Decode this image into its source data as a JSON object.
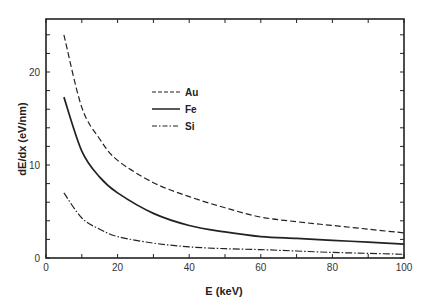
{
  "chart_data": {
    "type": "line",
    "title": "",
    "xlabel": "E (keV)",
    "ylabel": "dE/dx (eV/nm)",
    "xlim": [
      0,
      100
    ],
    "ylim": [
      0,
      25.7
    ],
    "xticks": [
      0,
      20,
      40,
      60,
      80,
      100
    ],
    "xtick_labels": [
      "0",
      "20",
      "40",
      "60",
      "80",
      "100"
    ],
    "x_minor_step": 10,
    "yticks": [
      0,
      10,
      20
    ],
    "ytick_labels": [
      "0",
      "10",
      "20"
    ],
    "y_minor_step": 2,
    "grid": false,
    "legend_position": "upper-center-left",
    "x": [
      5,
      10,
      15,
      20,
      30,
      40,
      50,
      60,
      70,
      80,
      90,
      100
    ],
    "series": [
      {
        "name": "Au",
        "style": "dashed",
        "values": [
          24.0,
          16.2,
          12.8,
          10.5,
          8.1,
          6.6,
          5.4,
          4.4,
          3.9,
          3.5,
          3.1,
          2.7
        ]
      },
      {
        "name": "Fe",
        "style": "solid",
        "values": [
          17.3,
          11.5,
          8.7,
          7.0,
          4.8,
          3.5,
          2.8,
          2.3,
          2.1,
          1.9,
          1.7,
          1.5
        ]
      },
      {
        "name": "Si",
        "style": "dash-dot",
        "values": [
          7.0,
          4.3,
          3.1,
          2.3,
          1.6,
          1.2,
          1.0,
          0.9,
          0.75,
          0.6,
          0.5,
          0.4
        ]
      }
    ]
  }
}
